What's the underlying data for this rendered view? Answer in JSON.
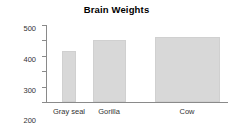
{
  "chart_data": {
    "type": "bar",
    "title": "Brain Weights",
    "xlabel": "",
    "ylabel": "Brain Weight (g)",
    "categories": [
      "Gray seal",
      "Gorilla",
      "Cow"
    ],
    "values": [
      330,
      400,
      420
    ],
    "bar_widths": [
      14,
      33,
      65
    ],
    "ylim": [
      0,
      500
    ],
    "yticks": [
      0,
      100,
      200,
      300,
      400,
      500
    ],
    "ytick_labels": [
      "0",
      "100",
      "200",
      "300",
      "400",
      "500"
    ],
    "grid": false,
    "legend": false,
    "bar_color": "#d8d8d8",
    "axis_color": "#8a8a8a"
  }
}
